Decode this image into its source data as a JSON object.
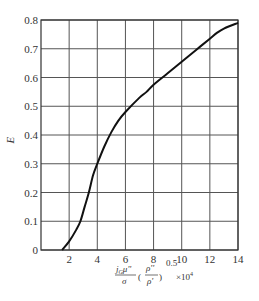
{
  "chart_data": {
    "type": "line",
    "title": "",
    "xlabel": "(j_G μ'' / σ) (ρ''/ρ')^0.5 × 10^4",
    "ylabel": "E",
    "xlim": [
      0,
      14
    ],
    "ylim": [
      0,
      0.8
    ],
    "grid": true,
    "legend": null,
    "x_ticks": [
      "2",
      "4",
      "6",
      "8",
      "10",
      "12",
      "14"
    ],
    "y_ticks": [
      "0",
      "0.1",
      "0.2",
      "0.3",
      "0.4",
      "0.5",
      "0.6",
      "0.7",
      "0.8"
    ],
    "series": [
      {
        "name": "E",
        "x": [
          1.5,
          2.0,
          2.5,
          2.8,
          3.1,
          3.4,
          3.7,
          4.0,
          4.5,
          5.0,
          5.5,
          6.0,
          7.0,
          7.5,
          8.0,
          9.0,
          10.0,
          11.0,
          12.0,
          12.5,
          13.0,
          14.0
        ],
        "y": [
          0.0,
          0.03,
          0.07,
          0.1,
          0.15,
          0.2,
          0.26,
          0.3,
          0.36,
          0.41,
          0.45,
          0.48,
          0.53,
          0.55,
          0.575,
          0.615,
          0.655,
          0.695,
          0.735,
          0.755,
          0.77,
          0.79
        ]
      }
    ]
  },
  "labels": {
    "y_axis": "E",
    "x_axis_numerator": "j",
    "x_axis_sub": "G",
    "x_axis_mu": "μ''",
    "x_axis_denominator": "σ",
    "x_axis_rho_num": "ρ''",
    "x_axis_rho_den": "ρ'",
    "x_axis_exp": "0.5",
    "x_axis_scale": "×10",
    "x_axis_scale_exp": "4",
    "origin": "0"
  }
}
